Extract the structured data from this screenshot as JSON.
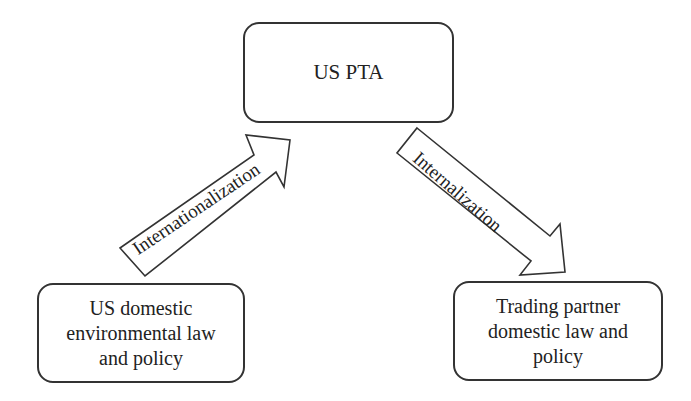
{
  "diagram": {
    "nodes": {
      "top": {
        "label": "US PTA"
      },
      "left": {
        "label": "US domestic\nenvironmental law\nand policy"
      },
      "right": {
        "label": "Trading partner\ndomestic law and\npolicy"
      }
    },
    "edges": {
      "up": {
        "label": "Internationalization",
        "from": "left",
        "to": "top"
      },
      "down": {
        "label": "Internalization",
        "from": "top",
        "to": "right"
      }
    },
    "colors": {
      "stroke": "#333333",
      "background": "#ffffff"
    }
  }
}
